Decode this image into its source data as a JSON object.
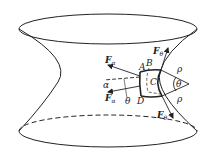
{
  "figure": {
    "colors": {
      "stroke": "#222222",
      "background": "#ffffff"
    },
    "labels": {
      "force_alpha_top": {
        "main": "F",
        "sub": "α"
      },
      "force_alpha_bottom": {
        "main": "F",
        "sub": "α"
      },
      "force_theta_top": {
        "main": "F",
        "sub": "θ"
      },
      "force_theta_bottom": {
        "main": "F",
        "sub": "θ"
      },
      "point_a": "A",
      "point_b": "B",
      "point_c": "C",
      "point_d": "D",
      "angle_alpha": "α",
      "angle_theta_bottom": "θ",
      "angle_theta_center": "θ",
      "radius_top": "ρ",
      "radius_bottom": "ρ"
    }
  }
}
